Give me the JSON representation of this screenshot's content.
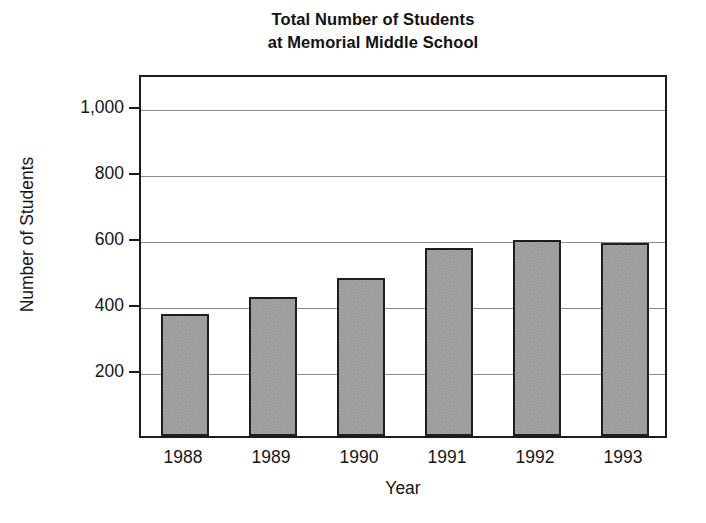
{
  "chart_data": {
    "type": "bar",
    "title": "Total Number of Students at Memorial Middle School",
    "title_lines": [
      "Total Number of Students",
      "at Memorial Middle School"
    ],
    "categories": [
      "1988",
      "1989",
      "1990",
      "1991",
      "1992",
      "1993"
    ],
    "values": [
      370,
      420,
      480,
      570,
      595,
      585
    ],
    "xlabel": "Year",
    "ylabel": "Number of Students",
    "ylim": [
      0,
      1100
    ],
    "yticks": [
      200,
      400,
      600,
      800,
      1000
    ],
    "ytick_labels": [
      "200",
      "400",
      "600",
      "800",
      "1,000"
    ],
    "grid": true,
    "legend": "none",
    "bar_color": "#a9a9a9",
    "bar_border_color": "#1f1f1f",
    "frame_color": "#1c1c1c",
    "gridline_color": "#8d8d8d",
    "text_color": "#161616"
  }
}
